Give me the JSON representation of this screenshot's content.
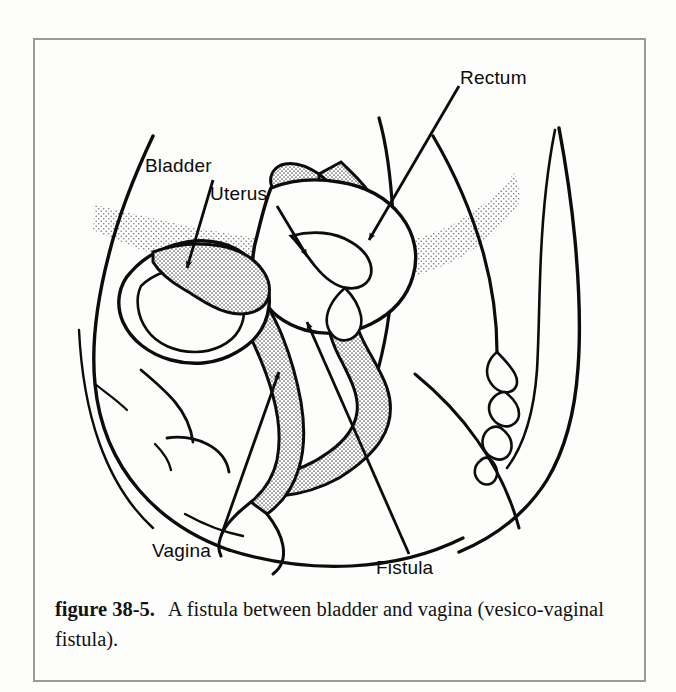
{
  "figure": {
    "labels": [
      {
        "id": "bladder",
        "text": "Bladder"
      },
      {
        "id": "uterus",
        "text": "Uterus"
      },
      {
        "id": "rectum",
        "text": "Rectum"
      },
      {
        "id": "vagina",
        "text": "Vagina"
      },
      {
        "id": "fistula",
        "text": "Fistula"
      }
    ],
    "caption": {
      "number": "figure 38-5.",
      "text": "A fistula between bladder and vagina (vesico-vaginal fistula)."
    },
    "colors": {
      "ink": "#0c0c0c",
      "border": "#9a9a9a",
      "paper": "#fdfdfc",
      "stipple": "#6d6d6d"
    }
  }
}
